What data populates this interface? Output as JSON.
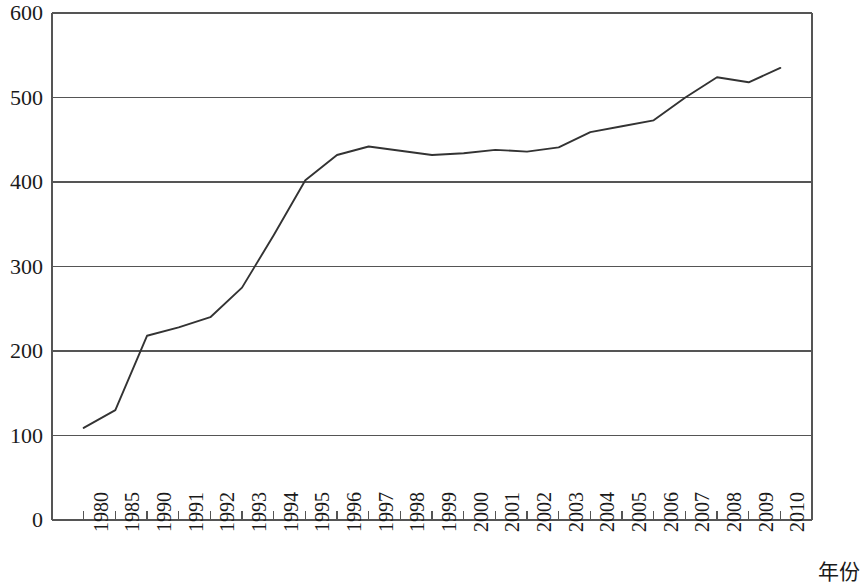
{
  "chart_data": {
    "type": "line",
    "title": "",
    "subtitle": "",
    "xlabel": "年份",
    "ylabel": "",
    "grid": true,
    "legend": false,
    "legend_position": "none",
    "line_color": "#333333",
    "axis_color": "#555555",
    "background": "#ffffff",
    "xlim_categories_count": 24,
    "ylim": [
      0,
      600
    ],
    "ytick_labels": [
      "600",
      "500",
      "400",
      "300",
      "200",
      "100",
      "0"
    ],
    "ytick_values": [
      600,
      500,
      400,
      300,
      200,
      100,
      0
    ],
    "categories": [
      "1980",
      "1985",
      "1990",
      "1991",
      "1992",
      "1993",
      "1994",
      "1995",
      "1996",
      "1997",
      "1998",
      "1999",
      "2000",
      "2001",
      "2002",
      "2003",
      "2004",
      "2005",
      "2006",
      "2007",
      "2008",
      "2009",
      "2010"
    ],
    "values": [
      109,
      130,
      218,
      228,
      240,
      275,
      337,
      402,
      432,
      442,
      437,
      432,
      434,
      438,
      436,
      441,
      459,
      466,
      473,
      500,
      524,
      518,
      535
    ],
    "series": [
      {
        "name": "",
        "values": [
          109,
          130,
          218,
          228,
          240,
          275,
          337,
          402,
          432,
          442,
          437,
          432,
          434,
          438,
          436,
          441,
          459,
          466,
          473,
          500,
          524,
          518,
          535
        ]
      }
    ]
  }
}
